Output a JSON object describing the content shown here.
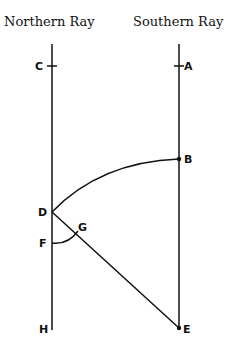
{
  "titles": {
    "north": "Northern Ray",
    "south": "Southern Ray"
  },
  "points": {
    "A": "A",
    "B": "B",
    "C": "C",
    "D": "D",
    "E": "E",
    "F": "F",
    "G": "G",
    "H": "H"
  }
}
